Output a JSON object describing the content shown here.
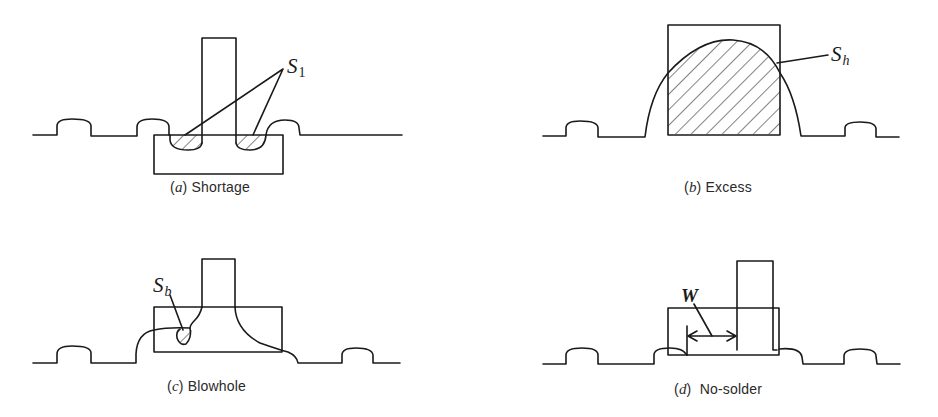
{
  "figure": {
    "panels": [
      {
        "id": "a",
        "caption_letter": "a",
        "caption_text": "Shortage",
        "label_symbol": "S",
        "label_subscript": "1"
      },
      {
        "id": "b",
        "caption_letter": "b",
        "caption_text": "Excess",
        "label_symbol": "S",
        "label_subscript": "h"
      },
      {
        "id": "c",
        "caption_letter": "c",
        "caption_text": "Blowhole",
        "label_symbol": "S",
        "label_subscript": "b"
      },
      {
        "id": "d",
        "caption_letter": "d",
        "caption_text": "No-solder",
        "label_symbol": "W",
        "label_subscript": ""
      }
    ],
    "colors": {
      "line": "#1a1a1a",
      "background": "#ffffff"
    }
  }
}
